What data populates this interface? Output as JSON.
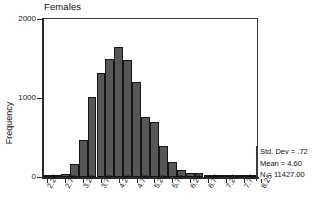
{
  "chart_data": {
    "type": "bar",
    "title": "Females",
    "xlabel": "",
    "ylabel": "Frequency",
    "ylim": [
      0,
      2000
    ],
    "ytick_labels": [
      "0",
      "1000",
      "2000"
    ],
    "ytick_values": [
      0,
      1000,
      2000
    ],
    "grid": false,
    "legend": null,
    "bin_width": 0.25,
    "categories": [
      "2.25",
      "2.50",
      "2.75",
      "3.00",
      "3.25",
      "3.50",
      "3.75",
      "4.00",
      "4.25",
      "4.50",
      "4.75",
      "5.00",
      "5.25",
      "5.50",
      "5.75",
      "6.00",
      "6.25",
      "6.50",
      "6.75",
      "7.00",
      "7.25",
      "7.50",
      "7.75",
      "8.25"
    ],
    "values": [
      10,
      20,
      40,
      160,
      470,
      1010,
      1320,
      1500,
      1650,
      1480,
      1200,
      760,
      700,
      390,
      185,
      95,
      50,
      55,
      20,
      12,
      6,
      4,
      3,
      2
    ],
    "xtick_labels": [
      "2.25",
      "2.75",
      "3.25",
      "3.75",
      "4.25",
      "4.75",
      "5.25",
      "5.75",
      "6.25",
      "6.75",
      "7.25",
      "7.75",
      "8.25"
    ],
    "annotations": {
      "std_dev": "Std. Dev = .72",
      "mean": "Mean = 4.60",
      "n": "N = 11427.00"
    },
    "colors": {
      "bar_fill": "#575757",
      "bar_edge": "#151515",
      "axis": "#2b2b2b",
      "text": "#111111",
      "background": "#ffffff"
    }
  }
}
